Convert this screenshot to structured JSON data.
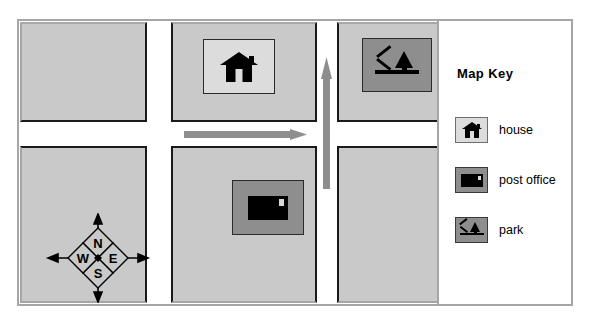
{
  "figure": {
    "type": "illustrated-street-map",
    "frame_color": "#a6a6a6",
    "block_fill": "#c9c9c9",
    "road_fill": "#ffffff",
    "arrow_color": "#8e8e8e",
    "ink_color": "#000000"
  },
  "map": {
    "blocks": [
      {
        "name": "northwest-block",
        "contains": ""
      },
      {
        "name": "northeast-block",
        "contains": "house"
      },
      {
        "name": "far-northeast-block",
        "contains": "park"
      },
      {
        "name": "southwest-block",
        "contains": "compass-rose"
      },
      {
        "name": "southeast-block",
        "contains": "post office"
      },
      {
        "name": "far-southeast-block",
        "contains": ""
      }
    ],
    "markers": [
      {
        "name": "house-marker",
        "label": "house"
      },
      {
        "name": "park-marker",
        "label": "park"
      },
      {
        "name": "post-office-marker",
        "label": "post office"
      }
    ],
    "direction_arrows": [
      {
        "name": "eastbound-arrow",
        "direction": "east"
      },
      {
        "name": "northbound-arrow",
        "direction": "north"
      }
    ]
  },
  "compass": {
    "name": "compass-rose",
    "north": "N",
    "east": "E",
    "south": "S",
    "west": "W"
  },
  "key": {
    "title": "Map Key",
    "entries": [
      {
        "icon": "house-icon",
        "label": "house",
        "swatch": "light"
      },
      {
        "icon": "post-office-icon",
        "label": "post office",
        "swatch": "dark"
      },
      {
        "icon": "park-icon",
        "label": "park",
        "swatch": "dark"
      }
    ]
  }
}
